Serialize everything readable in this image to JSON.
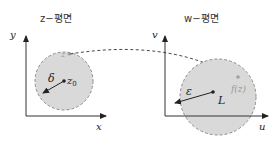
{
  "left_panel": {
    "title": "z−평면",
    "y_axis_label": "y",
    "x_axis_label": "x",
    "radius_label": "δ",
    "center_label": "z",
    "center_subscript": "0",
    "point_label": "z"
  },
  "right_panel": {
    "title": "w−평면",
    "y_axis_label": "v",
    "x_axis_label": "u",
    "radius_label": "ε",
    "center_label": "L",
    "point_label": "f(z)"
  },
  "colors": {
    "disk_fill": "#d9d9d9",
    "disk_border": "#8c8c8c",
    "axis": "#333333",
    "point_faint": "#a0a0a0"
  }
}
